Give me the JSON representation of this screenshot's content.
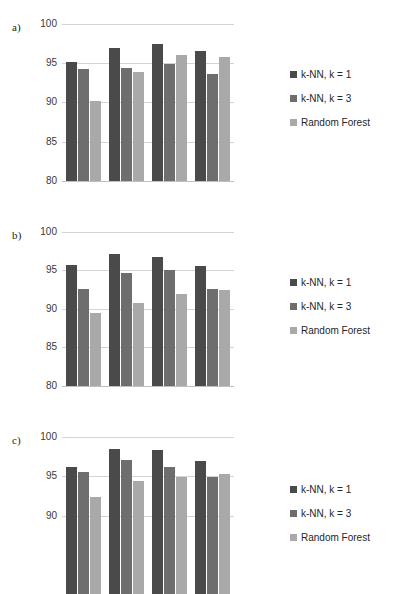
{
  "figure": {
    "panels": [
      {
        "label": "a)",
        "ytick_labels": [
          "100",
          "95",
          "90",
          "85",
          "80"
        ]
      },
      {
        "label": "b)",
        "ytick_labels": [
          "100",
          "95",
          "90",
          "85",
          "80"
        ]
      },
      {
        "label": "c)",
        "ytick_labels": [
          "100",
          "95",
          "90"
        ]
      }
    ],
    "legend": {
      "items": [
        {
          "name": "k-NN, k = 1",
          "color": "#4a4a4a"
        },
        {
          "name": "k-NN, k = 3",
          "color": "#6e6e6e"
        },
        {
          "name": "Random Forest",
          "color": "#a9a9a9"
        }
      ]
    }
  },
  "chart_data": [
    {
      "type": "bar",
      "panel": "a)",
      "title": "",
      "xlabel": "",
      "ylabel": "",
      "ylim": [
        80,
        100
      ],
      "yticks": [
        80,
        85,
        90,
        95,
        100
      ],
      "grid": true,
      "legend_position": "right",
      "categories": [
        "1",
        "2",
        "3",
        "4"
      ],
      "series": [
        {
          "name": "k-NN, k = 1",
          "color": "#4a4a4a",
          "values": [
            95.1,
            96.9,
            97.4,
            96.5
          ]
        },
        {
          "name": "k-NN, k = 3",
          "color": "#6e6e6e",
          "values": [
            94.2,
            94.4,
            94.9,
            93.6
          ]
        },
        {
          "name": "Random Forest",
          "color": "#a9a9a9",
          "values": [
            90.2,
            93.8,
            96.0,
            95.7
          ]
        }
      ]
    },
    {
      "type": "bar",
      "panel": "b)",
      "title": "",
      "xlabel": "",
      "ylabel": "",
      "ylim": [
        80,
        100
      ],
      "yticks": [
        80,
        85,
        90,
        95,
        100
      ],
      "grid": true,
      "legend_position": "right",
      "categories": [
        "1",
        "2",
        "3",
        "4"
      ],
      "series": [
        {
          "name": "k-NN, k = 1",
          "color": "#4a4a4a",
          "values": [
            95.7,
            97.1,
            96.7,
            95.6
          ]
        },
        {
          "name": "k-NN, k = 3",
          "color": "#6e6e6e",
          "values": [
            92.6,
            94.6,
            95.1,
            92.6
          ]
        },
        {
          "name": "Random Forest",
          "color": "#a9a9a9",
          "values": [
            89.5,
            90.8,
            91.9,
            92.4
          ]
        }
      ]
    },
    {
      "type": "bar",
      "panel": "c)",
      "title": "",
      "xlabel": "",
      "ylabel": "",
      "ylim": [
        80,
        100
      ],
      "yticks": [
        90,
        95,
        100
      ],
      "grid": true,
      "legend_position": "right",
      "categories": [
        "1",
        "2",
        "3",
        "4"
      ],
      "series": [
        {
          "name": "k-NN, k = 1",
          "color": "#4a4a4a",
          "values": [
            96.2,
            98.5,
            98.3,
            96.9
          ]
        },
        {
          "name": "k-NN, k = 3",
          "color": "#6e6e6e",
          "values": [
            95.5,
            97.1,
            96.2,
            94.9
          ]
        },
        {
          "name": "Random Forest",
          "color": "#a9a9a9",
          "values": [
            92.3,
            94.4,
            94.9,
            95.3
          ]
        }
      ]
    }
  ]
}
